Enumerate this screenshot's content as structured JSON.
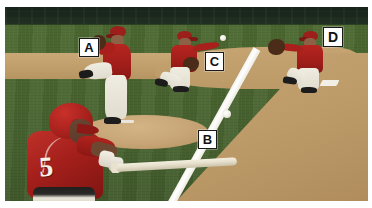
{
  "scene": {
    "kind": "baseball-field-photo-with-labels",
    "description": "Baseball play diagram photo: batter swinging in foreground, pitcher on mound, fielder throwing, first baseman catching",
    "colors": {
      "grass": "#4a6630",
      "infield_dirt": "#c2a06d",
      "foul_line": "#ffffff",
      "outfield_wall": "#1b2a1d",
      "uniform_red": "#a81f1b",
      "uniform_white": "#efece1",
      "label_box": "#ffffff",
      "label_text": "#111111",
      "frame": "#ffffff"
    }
  },
  "labels": [
    {
      "id": "a",
      "text": "A",
      "refers_to": "pitcher"
    },
    {
      "id": "b",
      "text": "B",
      "refers_to": "pitchers-mound-area"
    },
    {
      "id": "c",
      "text": "C",
      "refers_to": "infielder-throwing"
    },
    {
      "id": "d",
      "text": "D",
      "refers_to": "first-baseman-catching"
    }
  ],
  "batter": {
    "jersey_number": "5"
  },
  "balls": [
    {
      "id": "ball-high",
      "note": "ball in flight near fielder C"
    },
    {
      "id": "ball-low",
      "note": "ball in flight near label B"
    }
  ]
}
